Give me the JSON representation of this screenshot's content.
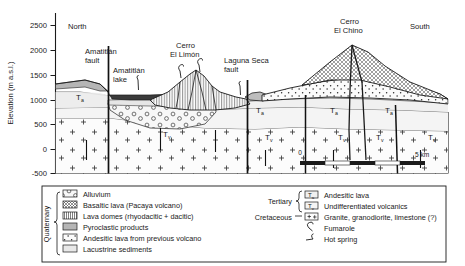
{
  "figure": {
    "type": "geologic-cross-section",
    "orientation_left": "North",
    "orientation_right": "South"
  },
  "yaxis": {
    "label": "Elevation (m a.s.l.)",
    "ticks": [
      "2500",
      "2000",
      "1500",
      "1000",
      "500",
      "0",
      "-500"
    ],
    "values": [
      2500,
      2000,
      1500,
      1000,
      500,
      0,
      -500
    ],
    "min": -500,
    "max": 2750
  },
  "scalebar": {
    "start_label": "0",
    "end_label": "5 km",
    "segments": 4
  },
  "features": [
    {
      "name": "amatitlan-fault",
      "label_line1": "Amatitlán",
      "label_line2": "fault"
    },
    {
      "name": "amatitlan-lake",
      "label_line1": "Amatitlán",
      "label_line2": "lake"
    },
    {
      "name": "cerro-el-limon",
      "label_line1": "Cerro",
      "label_line2": "El Limón"
    },
    {
      "name": "laguna-seca-fault",
      "label_line1": "Laguna Seca",
      "label_line2": "fault"
    },
    {
      "name": "cerro-el-chino",
      "label_line1": "Cerro",
      "label_line2": "El Chino"
    }
  ],
  "unit_labels": [
    {
      "name": "ta-left",
      "main": "T",
      "sub": "a",
      "x": 76,
      "y": 100
    },
    {
      "name": "tv-left",
      "main": "T",
      "sub": "v",
      "x": 163,
      "y": 137
    },
    {
      "name": "ta-mid",
      "main": "T",
      "sub": "a",
      "x": 256,
      "y": 113
    },
    {
      "name": "tv-mid",
      "main": "T",
      "sub": "v",
      "x": 265,
      "y": 140
    },
    {
      "name": "ta-chino-l",
      "main": "T",
      "sub": "a",
      "x": 330,
      "y": 113
    },
    {
      "name": "tv-chino-l",
      "main": "T",
      "sub": "v",
      "x": 338,
      "y": 140
    },
    {
      "name": "ta-chino-r",
      "main": "T",
      "sub": "a",
      "x": 385,
      "y": 113
    },
    {
      "name": "tv-chino-r",
      "main": "T",
      "sub": "v",
      "x": 383,
      "y": 140
    },
    {
      "name": "tv-right",
      "main": "T",
      "sub": "v",
      "x": 428,
      "y": 140
    }
  ],
  "legend": {
    "quaternary": {
      "category": "Quaternary",
      "items": [
        {
          "swatch": "alluvium",
          "label": "Alluvium"
        },
        {
          "swatch": "basaltic",
          "label": "Basaltic lava (Pacaya volcano)"
        },
        {
          "swatch": "domes",
          "label": "Lava domes (rhyodacitic + dacitic)"
        },
        {
          "swatch": "pyroclastic",
          "label": "Pyroclastic products"
        },
        {
          "swatch": "andesitic",
          "label": "Andesitic lava from previous volcano"
        },
        {
          "swatch": "lacustrine",
          "label": "Lacustrine sediments"
        }
      ]
    },
    "tertiary": {
      "category": "Tertiary",
      "items": [
        {
          "swatch": "ta",
          "swatch_main": "T",
          "swatch_sub": "a",
          "label": "Andesitic lava"
        },
        {
          "swatch": "tv",
          "swatch_main": "T",
          "swatch_sub": "v",
          "label": "Undifferentiated volcanics"
        }
      ]
    },
    "cretaceous": {
      "category": "Cretaceous",
      "items": [
        {
          "swatch": "granite",
          "label": "Granite, granodiorite, limestone (?)"
        }
      ]
    },
    "symbols": [
      {
        "swatch": "fumarole",
        "label": "Fumarole"
      },
      {
        "swatch": "hotspring",
        "label": "Hot spring"
      }
    ]
  },
  "colors": {
    "line": "#1a1a1a",
    "lake_fill": "#3a3a3a",
    "pyroclastic_fill": "#b9b9b9",
    "lacustrine_fill": "#eeeeee",
    "tertiary_fill": "#f2f2f2",
    "hatch": "#555555"
  }
}
